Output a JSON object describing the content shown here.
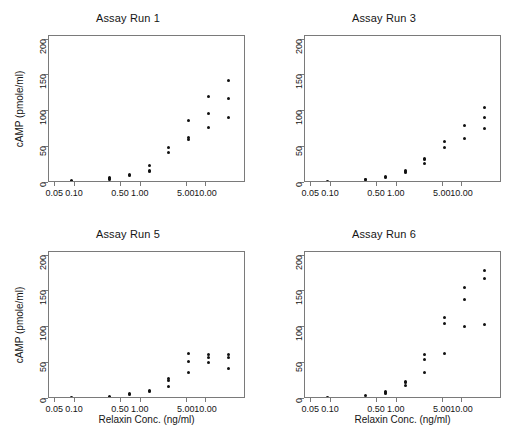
{
  "figure": {
    "axis_color": "#7a7a7a",
    "point_color": "#111111",
    "background": "#ffffff"
  },
  "axes": {
    "xlabel": "Relaxin Conc. (ng/ml)",
    "ylabel": "cAMP (pmole/ml)",
    "xscale": "log",
    "xlim": [
      0.04,
      40
    ],
    "ylim": [
      0,
      205
    ],
    "xticks": [
      0.05,
      0.1,
      0.5,
      1.0,
      5.0,
      10.0
    ],
    "xticklabels": [
      "0.05",
      "0.10",
      "0.50",
      "1.00",
      "5.00",
      "10.00"
    ],
    "yticks": [
      0,
      50,
      100,
      150,
      200
    ],
    "yticklabels": [
      "0",
      "50",
      "100",
      "150",
      "200"
    ],
    "grid": false
  },
  "chart_data": {
    "type": "scatter",
    "xlabel": "Relaxin Conc. (ng/ml)",
    "ylabel": "cAMP (pmole/ml)",
    "xscale": "log",
    "xlim": [
      0.04,
      40
    ],
    "ylim": [
      0,
      205
    ],
    "xticks": [
      0.05,
      0.1,
      0.5,
      1.0,
      5.0,
      10.0
    ],
    "yticks": [
      0,
      50,
      100,
      150,
      200
    ],
    "grid": false,
    "legend": "none",
    "panel_layout": "2x2",
    "panels": [
      {
        "title": "Assay Run 1",
        "row": 0,
        "col": 0,
        "x": [
          0.0878,
          0.0878,
          0.3333,
          0.3333,
          0.3333,
          0.6667,
          0.6667,
          1.3333,
          1.3333,
          1.3333,
          2.6667,
          2.6667,
          5.3333,
          5.3333,
          5.3333,
          10.6667,
          10.6667,
          10.6667,
          21.3333,
          21.3333,
          21.3333
        ],
        "y": [
          2.0,
          3.0,
          5.0,
          6.5,
          7.5,
          10.0,
          11.5,
          15.5,
          17.5,
          24.5,
          42.0,
          49.5,
          61.0,
          63.0,
          86.5,
          78.0,
          96.5,
          120.5,
          92.0,
          118.5,
          143.0
        ]
      },
      {
        "title": "Assay Run 3",
        "row": 0,
        "col": 1,
        "x": [
          0.0878,
          0.3333,
          0.3333,
          0.6667,
          0.6667,
          1.3333,
          1.3333,
          1.3333,
          2.6667,
          2.6667,
          2.6667,
          5.3333,
          5.3333,
          10.6667,
          10.6667,
          21.3333,
          21.3333,
          21.3333
        ],
        "y": [
          2.0,
          4.5,
          5.0,
          7.0,
          9.0,
          14.0,
          15.5,
          17.0,
          27.0,
          32.5,
          34.5,
          50.0,
          58.0,
          62.0,
          79.5,
          76.0,
          91.0,
          105.0
        ]
      },
      {
        "title": "Assay Run 5",
        "row": 1,
        "col": 0,
        "x": [
          0.0878,
          0.3333,
          0.6667,
          0.6667,
          1.3333,
          1.3333,
          2.6667,
          2.6667,
          2.6667,
          5.3333,
          5.3333,
          5.3333,
          10.6667,
          10.6667,
          10.6667,
          21.3333,
          21.3333,
          21.3333
        ],
        "y": [
          2.0,
          4.0,
          6.0,
          7.5,
          10.5,
          12.5,
          17.0,
          25.5,
          28.0,
          36.5,
          52.0,
          63.0,
          51.0,
          58.5,
          61.5,
          42.5,
          57.5,
          62.5
        ]
      },
      {
        "title": "Assay Run 6",
        "row": 1,
        "col": 1,
        "x": [
          0.0878,
          0.3333,
          0.6667,
          0.6667,
          0.6667,
          1.3333,
          1.3333,
          1.3333,
          2.6667,
          2.6667,
          2.6667,
          5.3333,
          5.3333,
          5.3333,
          10.6667,
          10.6667,
          10.6667,
          21.3333,
          21.3333,
          21.3333
        ],
        "y": [
          2.0,
          5.0,
          7.5,
          9.5,
          11.0,
          18.5,
          22.5,
          25.0,
          36.5,
          55.5,
          61.5,
          64.0,
          105.5,
          113.0,
          101.0,
          139.0,
          156.0,
          103.5,
          168.0,
          179.0
        ]
      }
    ]
  }
}
